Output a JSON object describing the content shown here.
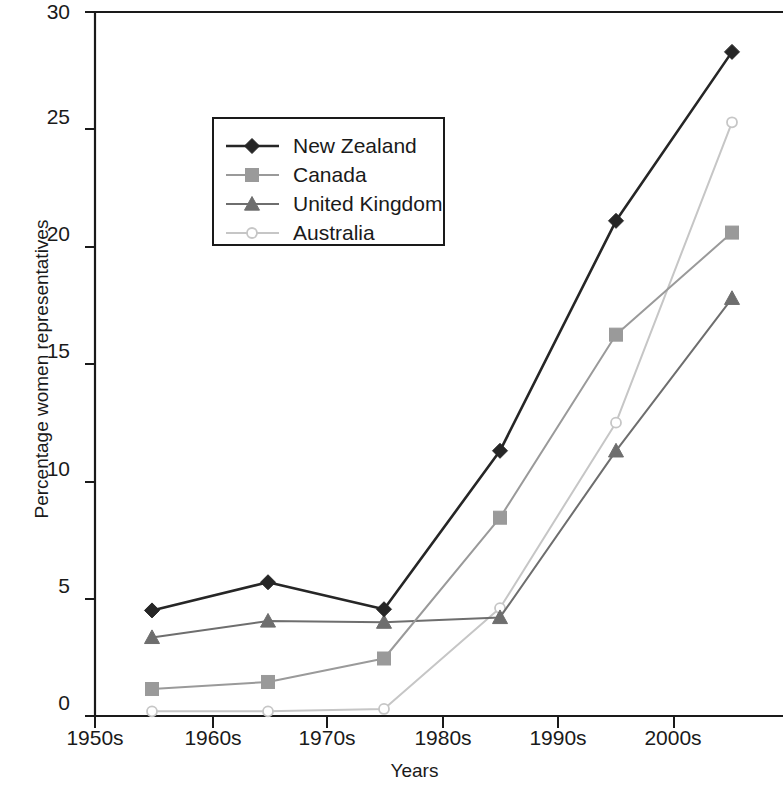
{
  "chart_data": {
    "type": "line",
    "title": "",
    "xlabel": "Years",
    "ylabel": "Percentage women representatives",
    "categories": [
      "1950s",
      "1960s",
      "1970s",
      "1980s",
      "1990s",
      "2000s"
    ],
    "ylim": [
      0,
      30
    ],
    "yticks": [
      0,
      5,
      10,
      15,
      20,
      25,
      30
    ],
    "xtick_labels": [
      "1950s",
      "1960s",
      "1970s",
      "1980s",
      "1990s",
      "2000s"
    ],
    "grid": false,
    "legend_position": "upper-left-inset",
    "series": [
      {
        "name": "New Zealand",
        "marker": "diamond",
        "color": "#262626",
        "values": [
          4.5,
          5.7,
          4.55,
          11.3,
          21.1,
          28.3
        ]
      },
      {
        "name": "Canada",
        "marker": "square",
        "color": "#9a9a9a",
        "values": [
          1.15,
          1.45,
          2.45,
          8.45,
          16.25,
          20.6
        ]
      },
      {
        "name": "United Kingdom",
        "marker": "triangle",
        "color": "#6e6e6e",
        "values": [
          3.35,
          4.05,
          4.0,
          4.2,
          11.3,
          17.8
        ]
      },
      {
        "name": "Australia",
        "marker": "open-circle",
        "color": "#c6c6c6",
        "values": [
          0.2,
          0.2,
          0.3,
          4.6,
          12.5,
          25.3
        ]
      }
    ]
  },
  "axis": {
    "y_tick_0": "0",
    "y_tick_5": "5",
    "y_tick_10": "10",
    "y_tick_15": "15",
    "y_tick_20": "20",
    "y_tick_25": "25",
    "y_tick_30": "30",
    "x_tick_1": "1950s",
    "x_tick_2": "1960s",
    "x_tick_3": "1970s",
    "x_tick_4": "1980s",
    "x_tick_5": "1990s",
    "x_tick_6": "2000s",
    "x_axis_title": "Years",
    "y_axis_title": "Percentage women representatives"
  },
  "legend": {
    "entry_1": "New Zealand",
    "entry_2": "Canada",
    "entry_3": "United Kingdom",
    "entry_4": "Australia"
  }
}
